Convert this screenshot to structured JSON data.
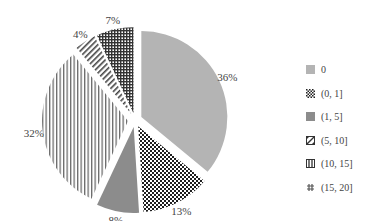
{
  "chart_data": {
    "type": "pie",
    "title": "",
    "categories": [
      "0",
      "(0, 1]",
      "(1, 5]",
      "(5, 10]",
      "(10, 15]",
      "(15, 20]"
    ],
    "values": [
      36,
      13,
      8,
      32,
      4,
      7
    ],
    "labels": [
      "36%",
      "13%",
      "8%",
      "32%",
      "4%",
      "7%"
    ],
    "start_angle": "12 o'clock",
    "direction": "clockwise",
    "exploded": true,
    "legend_position": "right"
  },
  "legend": {
    "items": [
      {
        "label": "0",
        "pattern": "solid-light-gray"
      },
      {
        "label": "(0, 1]",
        "pattern": "checkerboard"
      },
      {
        "label": "(1, 5]",
        "pattern": "solid-dark-gray"
      },
      {
        "label": "(5, 10]",
        "pattern": "diagonal-hatch"
      },
      {
        "label": "(10, 15]",
        "pattern": "vertical-lines"
      },
      {
        "label": "(15, 20]",
        "pattern": "grid-dots"
      }
    ]
  },
  "colors": {
    "light_gray": "#b4b4b4",
    "dark_gray": "#8c8c8c",
    "pattern_dark": "#222222",
    "stripe_gray": "#777777"
  }
}
